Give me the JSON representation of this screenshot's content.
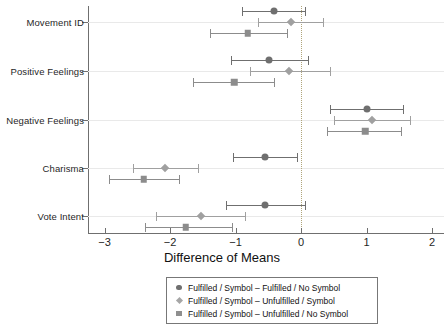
{
  "chart_data": {
    "type": "scatter",
    "title": "",
    "xlabel": "Difference of Means",
    "ylabel": "",
    "xlim": [
      -3.35,
      2.2
    ],
    "xticks": [
      -3,
      -2,
      -1,
      0,
      1,
      2
    ],
    "xticklabels": [
      "−3",
      "−2",
      "−1",
      "0",
      "1",
      "2"
    ],
    "categories": [
      "Movement ID",
      "Positive Feelings",
      "Negative Feelings",
      "Charisma",
      "Vote Intent"
    ],
    "grid": "horizontal",
    "reference_line": 0,
    "legend_position": "below",
    "orientation": "horizontal-error-bars",
    "series": [
      {
        "name": "Fulfilled / Symbol – Fulfilled / No Symbol",
        "marker": "circle",
        "color": "#6f6f6f",
        "values": [
          -0.41,
          -0.49,
          1.01,
          -0.55,
          -0.55
        ],
        "ci_low": [
          -0.9,
          -1.07,
          0.44,
          -1.04,
          -1.15
        ],
        "ci_high": [
          0.06,
          0.1,
          1.56,
          -0.06,
          0.06
        ]
      },
      {
        "name": "Fulfilled / Symbol – Unfulfilled / Symbol",
        "marker": "diamond",
        "color": "#a0a0a0",
        "values": [
          -0.16,
          -0.18,
          1.08,
          -2.08,
          -1.53
        ],
        "ci_low": [
          -0.66,
          -0.78,
          0.5,
          -2.57,
          -2.21
        ],
        "ci_high": [
          0.34,
          0.44,
          1.66,
          -1.58,
          -0.85
        ]
      },
      {
        "name": "Fulfilled / Symbol – Unfulfilled / No Symbol",
        "marker": "square",
        "color": "#8c8c8c",
        "values": [
          -0.81,
          -1.02,
          0.98,
          -2.4,
          -1.76
        ],
        "ci_low": [
          -1.39,
          -1.65,
          0.4,
          -2.93,
          -2.38
        ],
        "ci_high": [
          -0.21,
          -0.41,
          1.52,
          -1.86,
          -1.06
        ]
      }
    ]
  },
  "legend": {
    "entries": [
      {
        "symbol": "circle-marker",
        "label": "Fulfilled / Symbol – Fulfilled / No Symbol"
      },
      {
        "symbol": "diamond-marker",
        "label": "Fulfilled / Symbol – Unfulfilled / Symbol"
      },
      {
        "symbol": "square-marker",
        "label": "Fulfilled / Symbol – Unfulfilled / No Symbol"
      }
    ]
  }
}
